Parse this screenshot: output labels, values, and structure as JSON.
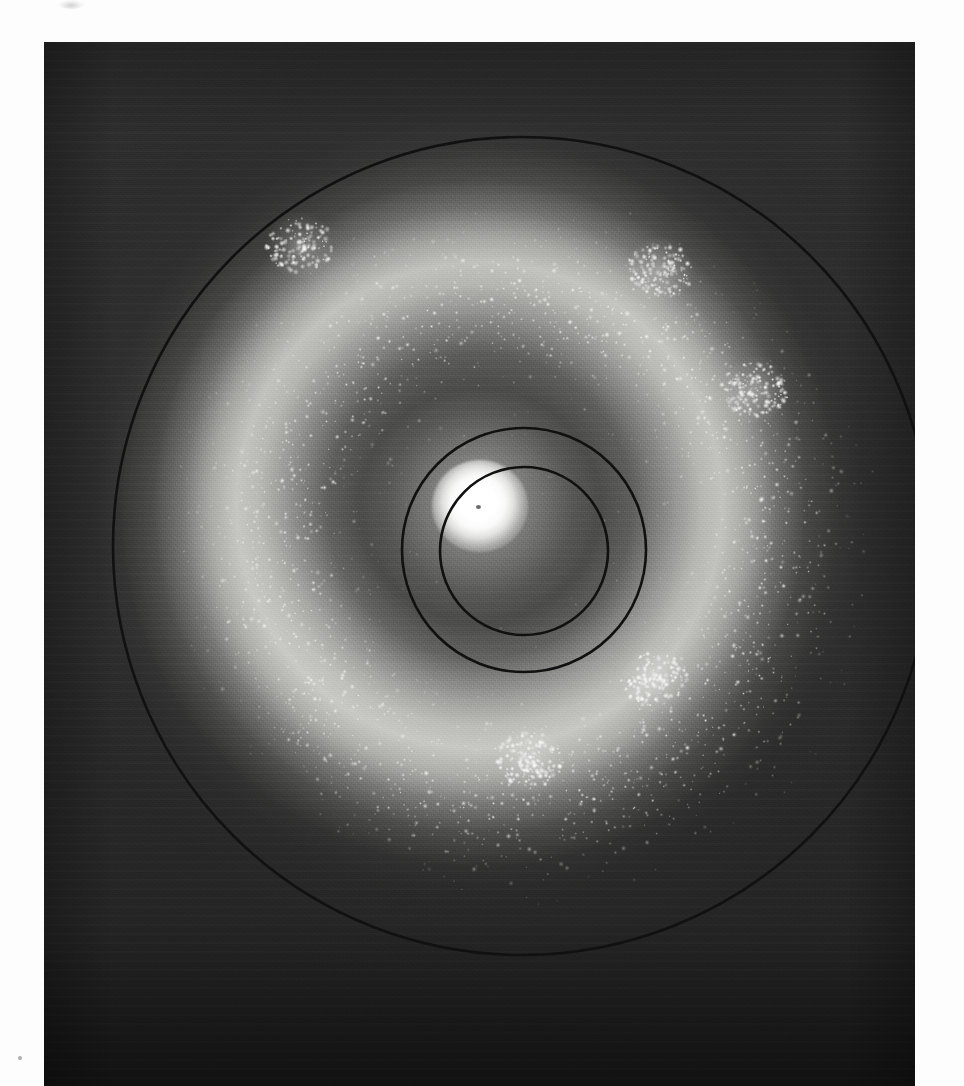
{
  "figure": {
    "kind": "astronomical-photographic-plate",
    "caption": "",
    "page_background": "#fdfdfd",
    "plate": {
      "x": 44,
      "y": 42,
      "width": 871,
      "height": 1044,
      "background_color": "#2b2b2b",
      "emulsion_tone": "#3a3a3a",
      "description": "Deep photographic exposure of a ring galaxy: saturated stellar nucleus, a broad low-surface-brightness inner gap, and a bright knotty star-forming ring resolved into individual stars and OB associations."
    },
    "overlay_circles": [
      {
        "name": "outer-aperture-circle",
        "cx": 478,
        "cy": 504,
        "r": 409,
        "stroke": "#111111",
        "stroke_width": 2.6
      },
      {
        "name": "middle-aperture-circle",
        "cx": 480,
        "cy": 508,
        "r": 122,
        "stroke": "#111111",
        "stroke_width": 2.6
      },
      {
        "name": "inner-aperture-circle",
        "cx": 480,
        "cy": 509,
        "r": 84,
        "stroke": "#111111",
        "stroke_width": 2.6
      }
    ],
    "features": [
      {
        "name": "nucleus",
        "cx": 480,
        "cy": 505,
        "label": ""
      },
      {
        "name": "star-ring",
        "inner_r": 150,
        "outer_r": 330,
        "label": ""
      },
      {
        "name": "bright-knot-sw",
        "cx": 655,
        "cy": 680,
        "label": ""
      },
      {
        "name": "star-cloud-s",
        "cx": 530,
        "cy": 760,
        "label": ""
      },
      {
        "name": "star-cloud-nw",
        "cx": 300,
        "cy": 245,
        "label": ""
      },
      {
        "name": "star-cloud-ne",
        "cx": 660,
        "cy": 270,
        "label": ""
      },
      {
        "name": "star-cloud-e",
        "cx": 755,
        "cy": 390,
        "label": ""
      }
    ],
    "marks": [
      {
        "name": "corner-smudge",
        "x": 58,
        "y": 0,
        "w": 26,
        "h": 9
      },
      {
        "name": "corner-dot",
        "x": 18,
        "y": 1056,
        "w": 4,
        "h": 4
      }
    ]
  },
  "chart_data": {
    "type": "heatmap",
    "title": "",
    "xlabel": "",
    "ylabel": "",
    "x": [
      0,
      10,
      20,
      30,
      40,
      50,
      60,
      70,
      80,
      90,
      100,
      120,
      140,
      160,
      180,
      200,
      220,
      240,
      260,
      280,
      300,
      320,
      340,
      360,
      380,
      400,
      420
    ],
    "xlabel_units": "radius (px)",
    "series": [
      {
        "name": "surface brightness",
        "values": [
          100,
          98,
          86,
          62,
          40,
          28,
          21,
          17,
          15,
          14,
          13,
          12,
          13,
          18,
          30,
          47,
          62,
          70,
          66,
          55,
          40,
          27,
          17,
          11,
          7,
          4,
          2
        ]
      }
    ],
    "ylim": [
      0,
      100
    ],
    "grid": false,
    "legend_position": "none",
    "annotations": [
      {
        "x": 0,
        "text": "nucleus"
      },
      {
        "x": 84,
        "text": "inner circle"
      },
      {
        "x": 122,
        "text": "middle circle"
      },
      {
        "x": 240,
        "text": "ring peak"
      },
      {
        "x": 409,
        "text": "outer circle"
      }
    ]
  }
}
